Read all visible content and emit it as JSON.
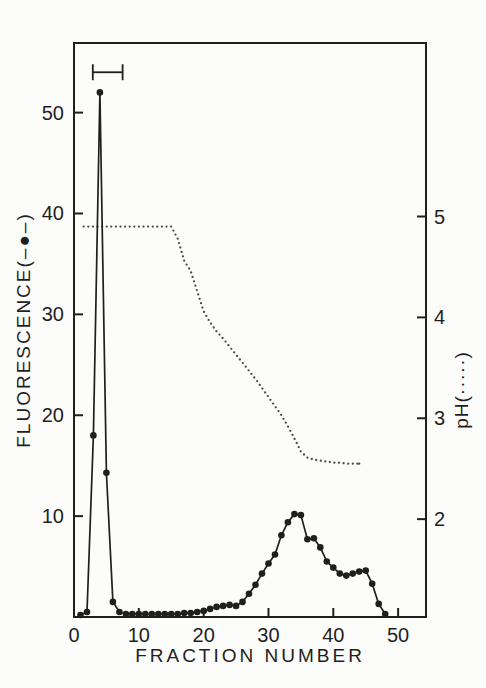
{
  "colors": {
    "background": "#fcfcfa",
    "ink": "#1f1f1f",
    "ph_dot": "#4a4a4a"
  },
  "chart_data": {
    "type": "line",
    "title": "",
    "xlabel": "FRACTION NUMBER",
    "ylabel_left": "FLUORESCENCE(–●–)",
    "ylabel_right": "pH(·····)",
    "xlim": [
      0,
      54.3
    ],
    "ylim_left": [
      0,
      56.9
    ],
    "ylim_right": [
      1.03,
      6.72
    ],
    "x_ticks": [
      0,
      10,
      20,
      30,
      40,
      50
    ],
    "y_ticks_left": [
      10,
      20,
      30,
      40,
      50
    ],
    "y_ticks_right": [
      2,
      3,
      4,
      5
    ],
    "grid": false,
    "framed": true,
    "legend_position": "in-axis-labels",
    "series": [
      {
        "name": "Fluorescence",
        "axis": "left",
        "marker": "filled-circle",
        "line": "solid",
        "x": [
          1,
          2,
          3,
          4,
          5,
          6,
          7,
          8,
          9,
          10,
          11,
          12,
          13,
          14,
          15,
          16,
          17,
          18,
          19,
          20,
          21,
          22,
          23,
          24,
          25,
          26,
          27,
          28,
          29,
          30,
          31,
          32,
          33,
          34,
          35,
          36,
          37,
          38,
          39,
          40,
          41,
          42,
          43,
          44,
          45,
          46,
          47,
          48
        ],
        "y": [
          0.2,
          0.5,
          18,
          52,
          14.3,
          1.5,
          0.5,
          0.3,
          0.3,
          0.3,
          0.3,
          0.3,
          0.3,
          0.3,
          0.3,
          0.3,
          0.4,
          0.4,
          0.5,
          0.6,
          0.8,
          1.0,
          1.1,
          1.2,
          1.1,
          1.5,
          2.3,
          3.2,
          4.3,
          5.3,
          6.2,
          8.1,
          9.4,
          10.2,
          10.1,
          7.7,
          7.8,
          6.9,
          5.5,
          4.9,
          4.3,
          4.1,
          4.3,
          4.5,
          4.6,
          3.3,
          1.3,
          0.3
        ]
      },
      {
        "name": "pH",
        "axis": "right",
        "marker": "small-dot",
        "line": "dotted",
        "x": [
          1.5,
          3,
          5,
          7,
          9,
          11,
          13,
          15,
          16,
          17,
          18,
          19,
          20,
          21,
          22,
          23,
          24,
          25,
          26,
          27,
          28,
          29,
          30,
          31,
          32,
          33,
          34,
          35,
          36,
          37,
          38,
          39,
          40,
          41,
          42,
          43,
          44
        ],
        "y": [
          4.9,
          4.9,
          4.9,
          4.9,
          4.9,
          4.9,
          4.9,
          4.9,
          4.78,
          4.56,
          4.46,
          4.26,
          4.06,
          3.95,
          3.86,
          3.79,
          3.71,
          3.63,
          3.55,
          3.47,
          3.39,
          3.3,
          3.21,
          3.12,
          3.03,
          2.92,
          2.8,
          2.67,
          2.61,
          2.59,
          2.58,
          2.57,
          2.56,
          2.56,
          2.55,
          2.55,
          2.55
        ]
      }
    ],
    "annotations": [
      {
        "type": "range-bracket",
        "axis": "left",
        "x_start": 2.9,
        "x_end": 7.5,
        "y": 54
      }
    ]
  }
}
